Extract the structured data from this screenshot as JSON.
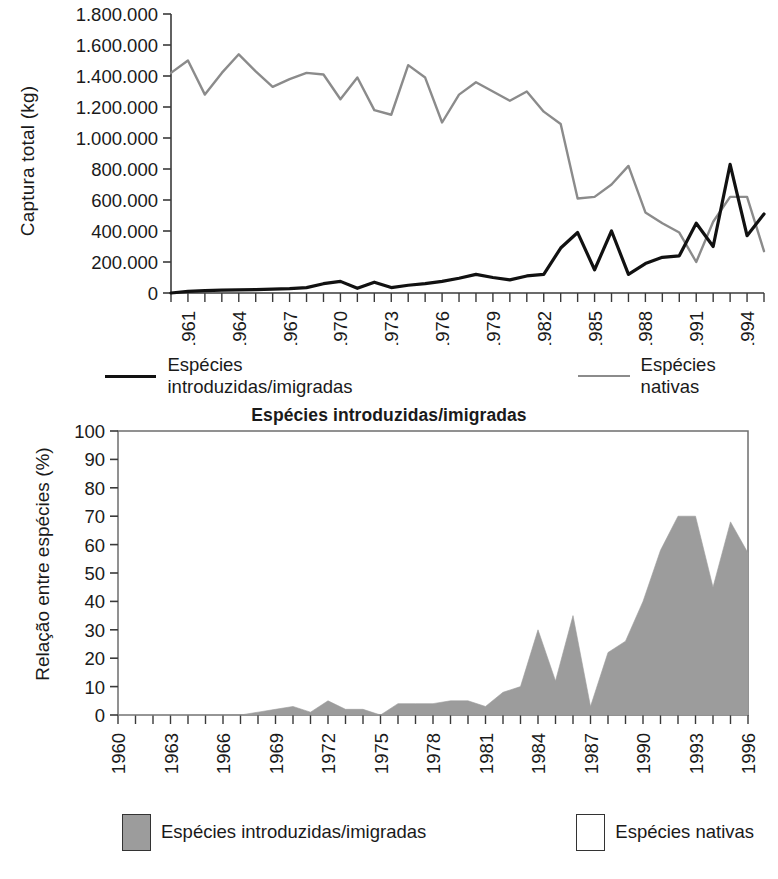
{
  "chart_data": [
    {
      "type": "line",
      "title": "",
      "xlabel": "",
      "ylabel": "Captura total (kg)",
      "ylim": [
        0,
        1800000
      ],
      "ytick_labels": [
        "0",
        "200.000",
        "400.000",
        "600.000",
        "800.000",
        "1.000.000",
        "1.200.000",
        "1.400.000",
        "1.600.000",
        "1.800.000"
      ],
      "ytick_values": [
        0,
        200000,
        400000,
        600000,
        800000,
        1000000,
        1200000,
        1400000,
        1600000,
        1800000
      ],
      "xlim": [
        1960,
        1995
      ],
      "xtick_labels": [
        "1961",
        "1964",
        "1967",
        "1970",
        "1973",
        "1976",
        "1979",
        "1982",
        "1985",
        "1988",
        "1991",
        "1994"
      ],
      "xtick_values": [
        1961,
        1964,
        1967,
        1970,
        1973,
        1976,
        1979,
        1982,
        1985,
        1988,
        1991,
        1994
      ],
      "grid": false,
      "legend_position": "below",
      "x": [
        1960,
        1961,
        1962,
        1963,
        1964,
        1965,
        1966,
        1967,
        1968,
        1969,
        1970,
        1971,
        1972,
        1973,
        1974,
        1975,
        1976,
        1977,
        1978,
        1979,
        1980,
        1981,
        1982,
        1983,
        1984,
        1985,
        1986,
        1987,
        1988,
        1989,
        1990,
        1991,
        1992,
        1993,
        1994,
        1995
      ],
      "series": [
        {
          "name": "Espécies nativas",
          "color": "#8b8b8b",
          "values": [
            1420000,
            1500000,
            1280000,
            1420000,
            1540000,
            1430000,
            1330000,
            1380000,
            1420000,
            1410000,
            1250000,
            1390000,
            1180000,
            1150000,
            1470000,
            1390000,
            1100000,
            1280000,
            1360000,
            1300000,
            1240000,
            1300000,
            1170000,
            1090000,
            610000,
            620000,
            700000,
            820000,
            520000,
            450000,
            390000,
            200000,
            460000,
            620000,
            620000,
            270000
          ]
        },
        {
          "name": "Espécies introduzidas/imigradas",
          "color": "#111111",
          "values": [
            0,
            10000,
            15000,
            18000,
            20000,
            22000,
            25000,
            28000,
            35000,
            60000,
            75000,
            30000,
            70000,
            35000,
            50000,
            60000,
            75000,
            95000,
            120000,
            100000,
            85000,
            110000,
            120000,
            290000,
            390000,
            150000,
            400000,
            120000,
            190000,
            230000,
            240000,
            450000,
            300000,
            830000,
            370000,
            510000
          ]
        }
      ]
    },
    {
      "type": "area",
      "title": "Espécies introduzidas/imigradas",
      "xlabel": "",
      "ylabel": "Relação entre espécies (%)",
      "ylim": [
        0,
        100
      ],
      "ytick_labels": [
        "0",
        "10",
        "20",
        "30",
        "40",
        "50",
        "60",
        "70",
        "80",
        "90",
        "100"
      ],
      "ytick_values": [
        0,
        10,
        20,
        30,
        40,
        50,
        60,
        70,
        80,
        90,
        100
      ],
      "xlim": [
        1960,
        1996
      ],
      "xtick_labels": [
        "1960",
        "1963",
        "1966",
        "1969",
        "1972",
        "1975",
        "1978",
        "1981",
        "1984",
        "1987",
        "1990",
        "1993",
        "1996"
      ],
      "xtick_values": [
        1960,
        1963,
        1966,
        1969,
        1972,
        1975,
        1978,
        1981,
        1984,
        1987,
        1990,
        1993,
        1996
      ],
      "grid": false,
      "legend_position": "below",
      "x": [
        1960,
        1961,
        1962,
        1963,
        1964,
        1965,
        1966,
        1967,
        1968,
        1969,
        1970,
        1971,
        1972,
        1973,
        1974,
        1975,
        1976,
        1977,
        1978,
        1979,
        1980,
        1981,
        1982,
        1983,
        1984,
        1985,
        1986,
        1987,
        1988,
        1989,
        1990,
        1991,
        1992,
        1993,
        1994,
        1995,
        1996
      ],
      "series": [
        {
          "name": "Espécies introduzidas/imigradas",
          "color": "#9c9c9c",
          "values": [
            0,
            0,
            0,
            0,
            0,
            0,
            0,
            0,
            1,
            2,
            3,
            1,
            5,
            2,
            2,
            0,
            4,
            4,
            4,
            5,
            5,
            3,
            8,
            10,
            30,
            12,
            35,
            3,
            22,
            26,
            40,
            58,
            70,
            70,
            45,
            68,
            57
          ]
        }
      ]
    }
  ],
  "chart1": {
    "ylabel": "Captura total (kg)",
    "legend": [
      {
        "label": "Espécies introduzidas/imigradas",
        "swatch": "dark-line-swatch"
      },
      {
        "label": "Espécies nativas",
        "swatch": "gray-line-swatch"
      }
    ]
  },
  "chart2": {
    "title": "Espécies introduzidas/imigradas",
    "ylabel": "Relação entre espécies (%)",
    "legend": [
      {
        "label": "Espécies introduzidas/imigradas",
        "swatch": "filled-box-swatch"
      },
      {
        "label": "Espécies nativas",
        "swatch": "empty-box-swatch"
      }
    ]
  },
  "colors": {
    "native_line": "#8b8b8b",
    "introduced_line": "#111111",
    "area_fill": "#9c9c9c",
    "axis": "#3a3a3a",
    "text": "#1a1a1a"
  }
}
